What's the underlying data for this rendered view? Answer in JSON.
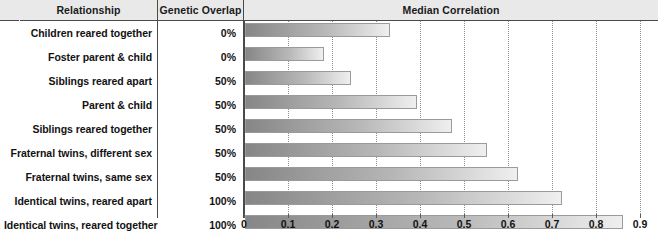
{
  "table": {
    "headers": {
      "relationship": "Relationship",
      "genetic_overlap": "Genetic Overlap",
      "median_correlation": "Median Correlation"
    },
    "rows": [
      {
        "relationship": "Children reared together",
        "genetic_overlap": "0%",
        "median_correlation": 0.33
      },
      {
        "relationship": "Foster parent & child",
        "genetic_overlap": "0%",
        "median_correlation": 0.18
      },
      {
        "relationship": "Siblings reared apart",
        "genetic_overlap": "50%",
        "median_correlation": 0.24
      },
      {
        "relationship": "Parent & child",
        "genetic_overlap": "50%",
        "median_correlation": 0.39
      },
      {
        "relationship": "Siblings reared together",
        "genetic_overlap": "50%",
        "median_correlation": 0.47
      },
      {
        "relationship": "Fraternal twins, different sex",
        "genetic_overlap": "50%",
        "median_correlation": 0.55
      },
      {
        "relationship": "Fraternal twins, same sex",
        "genetic_overlap": "50%",
        "median_correlation": 0.62
      },
      {
        "relationship": "Identical twins, reared apart",
        "genetic_overlap": "100%",
        "median_correlation": 0.72
      },
      {
        "relationship": "Identical twins, reared together",
        "genetic_overlap": "100%",
        "median_correlation": 0.86
      }
    ]
  },
  "chart_data": {
    "type": "bar",
    "orientation": "horizontal",
    "title": "Median Correlation",
    "xlabel": "",
    "ylabel": "",
    "xlim": [
      0,
      0.9
    ],
    "grid": true,
    "legend": "none",
    "categories": [
      "Children reared together",
      "Foster parent & child",
      "Siblings reared apart",
      "Parent & child",
      "Siblings reared together",
      "Fraternal twins, different sex",
      "Fraternal twins, same sex",
      "Identical twins, reared apart",
      "Identical twins, reared together"
    ],
    "values": [
      0.33,
      0.18,
      0.24,
      0.39,
      0.47,
      0.55,
      0.62,
      0.72,
      0.86
    ],
    "xticks": [
      "0",
      "0.1",
      "0.2",
      "0.3",
      "0.4",
      "0.5",
      "0.6",
      "0.7",
      "0.8",
      "0.9"
    ],
    "xtick_values": [
      0,
      0.1,
      0.2,
      0.3,
      0.4,
      0.5,
      0.6,
      0.7,
      0.8,
      0.9
    ]
  },
  "colors": {
    "header_background": "#e9e9e9",
    "rule": "#4a4a4a",
    "bar_dark": "#868686",
    "bar_light": "#efefef",
    "gridline": "#8f8f8f",
    "text": "#121212"
  }
}
